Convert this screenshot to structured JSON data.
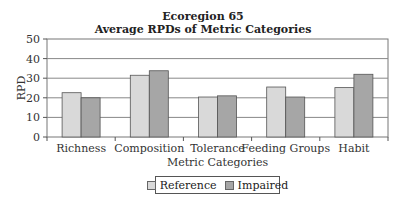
{
  "chart_data": {
    "type": "bar",
    "title": "Ecoregion 65",
    "subtitle": "Average RPDs of Metric Categories",
    "xlabel": "Metric Categories",
    "ylabel": "RPD",
    "ylim": [
      0,
      50
    ],
    "yticks": [
      0,
      10,
      20,
      30,
      40,
      50
    ],
    "grid": true,
    "legend_position": "bottom",
    "categories": [
      "Richness",
      "Composition",
      "Tolerance",
      "Feeding Groups",
      "Habit"
    ],
    "series": [
      {
        "name": "Reference",
        "color": "#d9d9d9",
        "values": [
          22.6,
          31.5,
          20.4,
          25.5,
          25.2
        ]
      },
      {
        "name": "Impaired",
        "color": "#a6a6a6",
        "values": [
          20.0,
          33.8,
          21.0,
          20.4,
          32.0
        ]
      }
    ]
  },
  "title": {
    "line1": "Ecoregion 65",
    "line2": "Average RPDs of Metric Categories"
  },
  "legend": {
    "reference": "Reference",
    "impaired": "Impaired"
  }
}
